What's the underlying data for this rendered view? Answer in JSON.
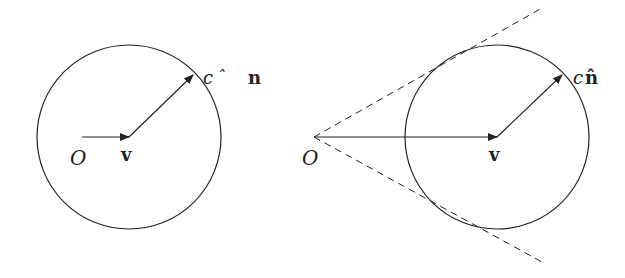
{
  "panels": [
    {
      "id": "left",
      "origin_label": "O",
      "velocity_label": "v",
      "radius_label_c": "c",
      "radius_label_hat": "ˆ",
      "radius_label_n": "n",
      "circle": {
        "cx": 129,
        "cy": 137,
        "r": 92
      },
      "origin_arrow": {
        "x1": 82,
        "y1": 137,
        "x2": 129,
        "y2": 137
      },
      "radius_arrow": {
        "x1": 129,
        "y1": 137,
        "x2": 193,
        "y2": 75
      },
      "tangent_lines": false
    },
    {
      "id": "right",
      "origin_label": "O",
      "velocity_label": "v",
      "radius_label_c": "c",
      "radius_label_n": "n̂",
      "circle": {
        "cx": 497,
        "cy": 137,
        "r": 92
      },
      "origin_arrow": {
        "x1": 314,
        "y1": 137,
        "x2": 497,
        "y2": 137
      },
      "radius_arrow": {
        "x1": 497,
        "y1": 137,
        "x2": 562,
        "y2": 75
      },
      "tangent_lines": true
    }
  ],
  "colors": {
    "stroke": "#222222",
    "background": "#ffffff"
  }
}
